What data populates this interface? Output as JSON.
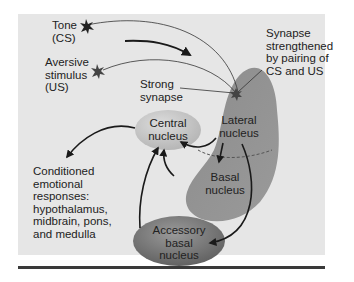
{
  "diagram": {
    "labels": {
      "tone": "Tone\n(CS)",
      "aversive": "Aversive\nstimulus\n(US)",
      "strong_synapse": "Strong\nsynapse",
      "synapse_strengthened": "Synapse\nstrengthened\nby pairing of\nCS and US",
      "central_nucleus": "Central\nnucleus",
      "lateral_nucleus": "Lateral\nnucleus",
      "basal_nucleus": "Basal\nnucleus",
      "accessory_basal_nucleus": "Accessory\nbasal\nnucleus",
      "conditioned_responses": "Conditioned\nemotional\nresponses:\nhypothalamus,\nmidbrain, pons,\nand medulla"
    },
    "colors": {
      "background": "#e6e6e6",
      "amygdala_shape": "#8a8a8a",
      "central_nucleus": "#c4c4c4",
      "accessory_nucleus": "#7a7a7a",
      "arrows": "#1a1a1a"
    }
  }
}
